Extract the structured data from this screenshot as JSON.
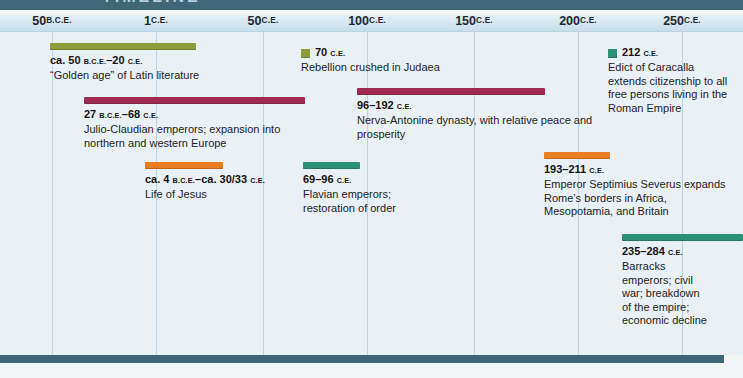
{
  "page": {
    "title_clipped": "TIMELINE"
  },
  "colors": {
    "header": "#3f6777",
    "axis_bg": "#cfe1ec",
    "plot_bg": "#e9f1f6",
    "gridline": "#b7d8e3",
    "olive": "#8e9c3b",
    "maroon": "#9e2a52",
    "orange": "#e87d21",
    "teal": "#2d9273"
  },
  "chart_data": {
    "type": "timeline",
    "title": "TIMELINE",
    "axis": {
      "unit": "years",
      "range_years": [
        -50,
        285
      ],
      "gridlines": true,
      "ticks": [
        {
          "label": "50 B.C.E.",
          "year": -50,
          "x": 52
        },
        {
          "label": "1 C.E.",
          "year": 1,
          "x": 156
        },
        {
          "label": "50 C.E.",
          "year": 50,
          "x": 263
        },
        {
          "label": "100 C.E.",
          "year": 100,
          "x": 367
        },
        {
          "label": "150 C.E.",
          "year": 150,
          "x": 474
        },
        {
          "label": "200 C.E.",
          "year": 200,
          "x": 578
        },
        {
          "label": "250 C.E.",
          "year": 250,
          "x": 682
        }
      ]
    },
    "events": [
      {
        "id": "golden-age-latin-literature",
        "type": "bar",
        "color": "olive",
        "start_year": -50,
        "end_year": 20,
        "date_label": "ca. 50 B.C.E.–20 C.E.",
        "description": "“Golden age” of Latin literature",
        "layout": {
          "left": 50,
          "top": 43,
          "width": 146,
          "text_width": 185
        }
      },
      {
        "id": "julio-claudian-emperors",
        "type": "bar",
        "color": "maroon",
        "start_year": -27,
        "end_year": 68,
        "date_label": "27 B.C.E.–68 C.E.",
        "description": "Julio-Claudian emperors; expansion into northern and western Europe",
        "layout": {
          "left": 84,
          "top": 97,
          "width": 221,
          "text_width": 232
        }
      },
      {
        "id": "life-of-jesus",
        "type": "bar",
        "color": "orange",
        "start_year": -4,
        "end_year": 31.5,
        "date_label": "ca. 4 B.C.E.–ca. 30/33 C.E.",
        "description": "Life of Jesus",
        "layout": {
          "left": 145,
          "top": 162,
          "width": 78,
          "text_width": 150
        }
      },
      {
        "id": "rebellion-judaea",
        "type": "point",
        "color": "olive",
        "year": 70,
        "date_label": "70 C.E.",
        "description": "Rebellion crushed in Judaea",
        "layout": {
          "left": 301,
          "top": 46,
          "text_width": 175
        }
      },
      {
        "id": "flavian-emperors",
        "type": "bar",
        "color": "teal",
        "start_year": 69,
        "end_year": 96,
        "date_label": "69–96 C.E.",
        "description": "Flavian emperors; restoration of order",
        "layout": {
          "left": 303,
          "top": 162,
          "width": 57,
          "text_width": 95
        }
      },
      {
        "id": "nerva-antonine-dynasty",
        "type": "bar",
        "color": "maroon",
        "start_year": 96,
        "end_year": 192,
        "date_label": "96–192 C.E.",
        "description": "Nerva-Antonine dynasty, with relative peace and prosperity",
        "layout": {
          "left": 357,
          "top": 88,
          "width": 188,
          "text_width": 248
        }
      },
      {
        "id": "septimius-severus",
        "type": "bar",
        "color": "orange",
        "start_year": 193,
        "end_year": 211,
        "date_label": "193–211 C.E.",
        "description": "Emperor Septimius Severus expands Rome’s borders in Africa, Mesopotamia, and Britain",
        "layout": {
          "left": 544,
          "top": 152,
          "width": 66,
          "text_width": 185
        }
      },
      {
        "id": "edict-of-caracalla",
        "type": "point",
        "color": "teal",
        "year": 212,
        "date_label": "212 C.E.",
        "description": "Edict of Caracalla extends citizenship to all free persons living in the Roman Empire",
        "layout": {
          "left": 608,
          "top": 46,
          "text_width": 120
        }
      },
      {
        "id": "barracks-emperors",
        "type": "bar",
        "color": "teal",
        "start_year": 235,
        "end_year": 284,
        "date_label": "235–284 C.E.",
        "description": "Barracks emperors; civil war; breakdown of the empire; economic decline",
        "layout": {
          "left": 622,
          "top": 234,
          "width": 121,
          "text_width": 88
        }
      }
    ]
  }
}
